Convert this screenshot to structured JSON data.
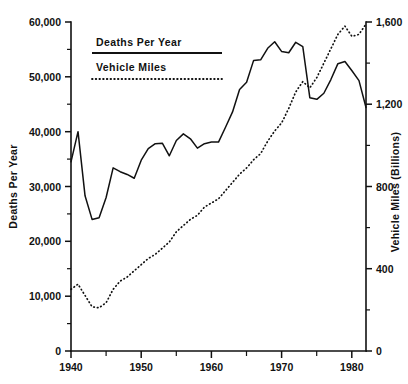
{
  "chart_data": {
    "type": "line",
    "title": "",
    "subtitle": "",
    "xlabel": "",
    "ylabel": "Deaths Per Year",
    "y2label": "Vehicle Miles (Billions)",
    "grid": false,
    "legend_position": "upper-left-inside",
    "xlim": [
      1940,
      1982
    ],
    "ylim": [
      0,
      60000
    ],
    "y2lim": [
      0,
      1600
    ],
    "x_ticks_major": [
      1940,
      1950,
      1960,
      1970,
      1980
    ],
    "x_tick_labels": [
      "1940",
      "1950",
      "1960",
      "1970",
      "1980"
    ],
    "x_ticks_minor": [
      1945,
      1955,
      1965,
      1975
    ],
    "y_ticks_major": [
      0,
      10000,
      20000,
      30000,
      40000,
      50000,
      60000
    ],
    "y_tick_labels": [
      "0",
      "10,000",
      "20,000",
      "30,000",
      "40,000",
      "50,000",
      "60,000"
    ],
    "y_ticks_minor": [
      5000,
      15000,
      25000,
      35000,
      45000,
      55000
    ],
    "y2_ticks_major": [
      0,
      400,
      800,
      1200,
      1600
    ],
    "y2_tick_labels": [
      "0",
      "400",
      "800",
      "1,200",
      "1,600"
    ],
    "y2_ticks_minor": [
      200,
      600,
      1000,
      1400
    ],
    "x": [
      1940,
      1941,
      1942,
      1943,
      1944,
      1945,
      1946,
      1947,
      1948,
      1949,
      1950,
      1951,
      1952,
      1953,
      1954,
      1955,
      1956,
      1957,
      1958,
      1959,
      1960,
      1961,
      1962,
      1963,
      1964,
      1965,
      1966,
      1967,
      1968,
      1969,
      1970,
      1971,
      1972,
      1973,
      1974,
      1975,
      1976,
      1977,
      1978,
      1979,
      1980,
      1981,
      1982
    ],
    "series": [
      {
        "name": "Deaths Per Year",
        "axis": "left",
        "style": "solid",
        "units": "deaths",
        "values": [
          34500,
          40000,
          28300,
          24000,
          24300,
          28000,
          33400,
          32700,
          32200,
          31500,
          34800,
          36900,
          37800,
          37900,
          35600,
          38400,
          39600,
          38700,
          37000,
          37800,
          38100,
          38100,
          40800,
          43600,
          47700,
          49000,
          53000,
          53100,
          55200,
          56400,
          54600,
          54400,
          56300,
          55500,
          46200,
          45900,
          47000,
          49500,
          52400,
          52800,
          51100,
          49300,
          44400
        ]
      },
      {
        "name": "Vehicle Miles",
        "axis": "right",
        "style": "dotted",
        "units": "billions of miles",
        "values": [
          300,
          325,
          270,
          215,
          210,
          235,
          300,
          340,
          360,
          390,
          420,
          450,
          470,
          500,
          530,
          580,
          610,
          640,
          660,
          700,
          720,
          740,
          780,
          820,
          860,
          890,
          930,
          960,
          1020,
          1070,
          1110,
          1180,
          1260,
          1310,
          1280,
          1330,
          1400,
          1470,
          1540,
          1580,
          1530,
          1540,
          1590
        ]
      }
    ],
    "annotations": []
  },
  "legend": {
    "items": [
      {
        "label": "Deaths Per Year",
        "style": "solid"
      },
      {
        "label": "Vehicle Miles",
        "style": "dotted"
      }
    ]
  },
  "axes": {
    "left_title": "Deaths Per Year",
    "right_title": "Vehicle Miles (Billions)",
    "left_labels": [
      "60,000",
      "50,000",
      "40,000",
      "30,000",
      "20,000",
      "10,000",
      "0"
    ],
    "right_labels": [
      "1,600",
      "1,200",
      "800",
      "400",
      "0"
    ],
    "bottom_labels": [
      "1940",
      "1950",
      "1960",
      "1970",
      "1980"
    ]
  },
  "colors": {
    "ink": "#111111",
    "background": "#ffffff"
  }
}
